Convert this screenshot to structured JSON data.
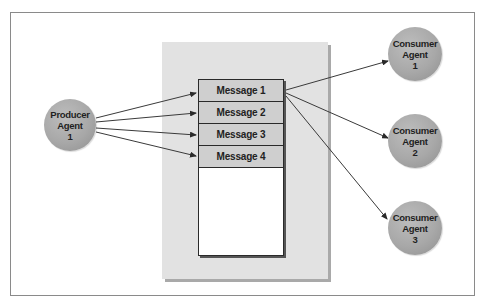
{
  "diagram": {
    "type": "message-queue",
    "producer": {
      "label": "Producer\nAgent\n1",
      "cx": 70,
      "cy": 125,
      "r": 26
    },
    "queue": {
      "messages": [
        "Message 1",
        "Message 2",
        "Message 3",
        "Message 4"
      ],
      "empty_slot": ""
    },
    "consumers": [
      {
        "label": "Consumer\nAgent\n1",
        "cx": 415,
        "cy": 54,
        "r": 27
      },
      {
        "label": "Consumer\nAgent\n2",
        "cx": 415,
        "cy": 141,
        "r": 27
      },
      {
        "label": "Consumer\nAgent\n3",
        "cx": 415,
        "cy": 228,
        "r": 27
      }
    ],
    "edges": [
      {
        "from": "Producer Agent 1",
        "to": "Message 1"
      },
      {
        "from": "Producer Agent 1",
        "to": "Message 2"
      },
      {
        "from": "Producer Agent 1",
        "to": "Message 3"
      },
      {
        "from": "Producer Agent 1",
        "to": "Message 4"
      },
      {
        "from": "Message 1",
        "to": "Consumer Agent 1"
      },
      {
        "from": "Message 1",
        "to": "Consumer Agent 2"
      },
      {
        "from": "Message 1",
        "to": "Consumer Agent 3"
      }
    ],
    "colors": {
      "agent_fill": "#a8a8a8",
      "message_fill": "#cfcfcf",
      "panel_fill": "#e2e2e2",
      "line": "#3a3a3a"
    }
  }
}
